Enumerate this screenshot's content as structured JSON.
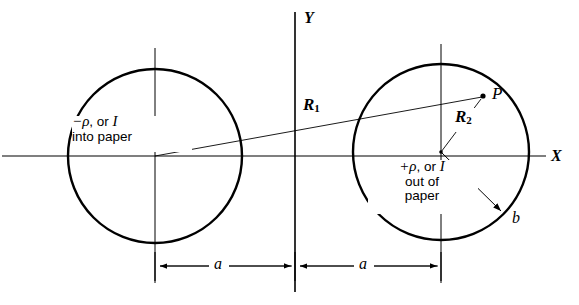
{
  "figure": {
    "background_color": "#ffffff",
    "stroke_color": "#000000",
    "axes": {
      "x_axis_label": "X",
      "y_axis_label": "Y",
      "x_axis_y": 156,
      "y_axis_x": 295
    },
    "left_conductor": {
      "name": "left-circle",
      "center_x": 155,
      "center_y": 156,
      "radius": 87,
      "label_line1_sign": "−",
      "label_line1_rho": "ρ",
      "label_line1_mid": ", or ",
      "label_line1_current": "I",
      "label_line2": "into paper"
    },
    "right_conductor": {
      "name": "right-circle",
      "center_x": 441,
      "center_y": 152,
      "radius": 88,
      "label_line1_sign": "+",
      "label_line1_rho": "ρ",
      "label_line1_mid": ", or ",
      "label_line1_current": "I",
      "label_line2": "out of",
      "label_line3": "paper"
    },
    "point_p": {
      "label": "P",
      "x": 483,
      "y": 97
    },
    "radius_vectors": [
      {
        "label": "R",
        "subscript": "1",
        "from_x": 155,
        "from_y": 156,
        "to_x": 483,
        "to_y": 97,
        "label_x": 305,
        "label_y": 100
      },
      {
        "label": "R",
        "subscript": "2",
        "from_x": 441,
        "from_y": 152,
        "to_x": 483,
        "to_y": 97,
        "label_x": 455,
        "label_y": 112
      }
    ],
    "radius_b": {
      "label": "b",
      "from_x": 441,
      "from_y": 152,
      "to_x": 503,
      "to_y": 213,
      "label_x": 511,
      "label_y": 211
    },
    "dimensions": [
      {
        "label": "a",
        "from_x": 155,
        "to_x": 295,
        "y": 266,
        "label_x": 218,
        "label_y": 254
      },
      {
        "label": "a",
        "from_x": 295,
        "to_x": 441,
        "y": 266,
        "label_x": 362,
        "label_y": 254
      }
    ]
  }
}
